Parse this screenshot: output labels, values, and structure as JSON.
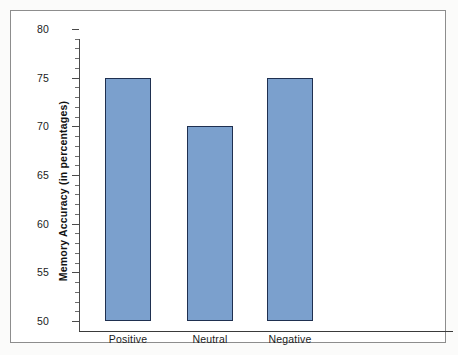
{
  "figure": {
    "background_color": "#fbfbfa",
    "plot_background_color": "#ffffff",
    "frame_color": "#8d8d8d"
  },
  "chart_data": {
    "type": "bar",
    "title": "",
    "subtitle": "",
    "categories": [
      "Positive",
      "Neutral",
      "Negative"
    ],
    "values": [
      75,
      70,
      75
    ],
    "xlabel": "",
    "ylabel": "Memory Accuracy (in percentages)",
    "ylim": [
      50,
      80
    ],
    "ytick_labels": [
      "50",
      "55",
      "60",
      "65",
      "70",
      "75",
      "80"
    ],
    "ytick_values": [
      50,
      55,
      60,
      65,
      70,
      75,
      80
    ],
    "minor_tick_interval": 1,
    "grid": false,
    "legend": null,
    "legend_position": "none",
    "bar_fill_color": "#7ba0cd",
    "bar_edge_color": "#1f3050",
    "axis_color": "#4a4a4a"
  }
}
